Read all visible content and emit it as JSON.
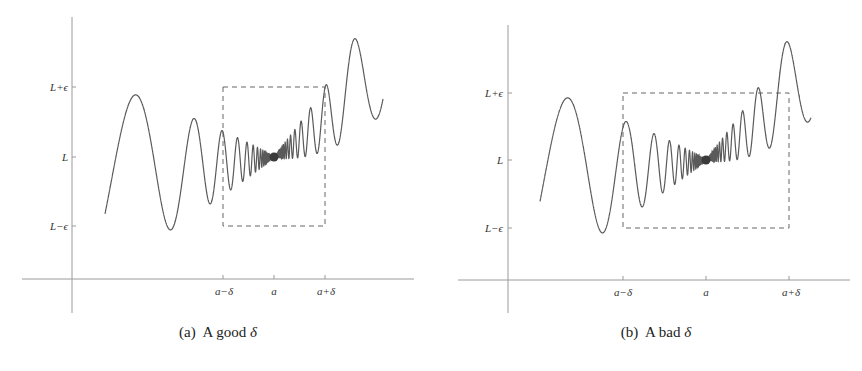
{
  "figure": {
    "panels": [
      {
        "id": "a",
        "caption_prefix": "(a)",
        "caption_text": "A good",
        "caption_symbol": "δ",
        "y_ticks": [
          "L+ϵ",
          "L",
          "L−ϵ"
        ],
        "x_ticks": [
          "a−δ",
          "a",
          "a+δ"
        ]
      },
      {
        "id": "b",
        "caption_prefix": "(b)",
        "caption_text": "A bad",
        "caption_symbol": "δ",
        "y_ticks": [
          "L+ϵ",
          "L",
          "L−ϵ"
        ],
        "x_ticks": [
          "a−δ",
          "a",
          "a+δ"
        ]
      }
    ],
    "colors": {
      "curve": "#555555",
      "axes": "#999999",
      "box": "#666666",
      "point": "#333333"
    }
  },
  "chart_data": [
    {
      "type": "line",
      "title": "(a) A good δ",
      "xlabel": "",
      "ylabel": "",
      "x_tick_labels": [
        "a−δ",
        "a",
        "a+δ"
      ],
      "y_tick_labels": [
        "L−ϵ",
        "L",
        "L+ϵ"
      ],
      "annotations": [
        "dashed box spanning x∈[a−δ, a+δ], y∈[L−ϵ, L+ϵ] — curve stays within box",
        "filled point at (a, L)"
      ],
      "description": "Oscillating function whose oscillations shrink in amplitude and increase in frequency approaching x=a, converging to L",
      "grid": false
    },
    {
      "type": "line",
      "title": "(b) A bad δ",
      "xlabel": "",
      "ylabel": "",
      "x_tick_labels": [
        "a−δ",
        "a",
        "a+δ"
      ],
      "y_tick_labels": [
        "L−ϵ",
        "L",
        "L+ϵ"
      ],
      "annotations": [
        "dashed box spanning x∈[a−δ, a+δ], y∈[L−ϵ, L+ϵ] — curve exits box on the right side",
        "filled point at (a, L)"
      ],
      "description": "Same oscillating function with a wider δ; the curve leaves the ε-band within the δ-interval",
      "grid": false
    }
  ]
}
